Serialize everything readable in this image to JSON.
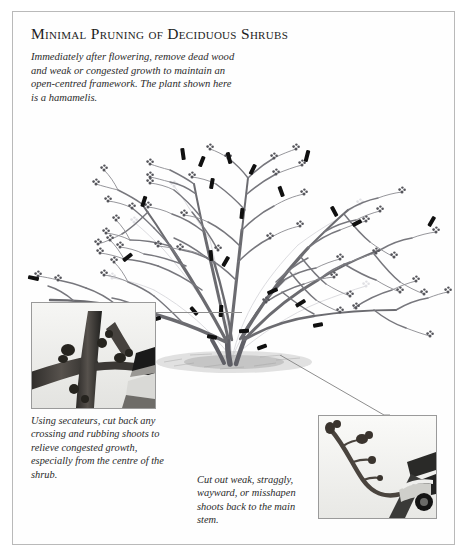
{
  "page": {
    "title": "Minimal Pruning of Deciduous Shrubs",
    "intro": "Immediately after flowering, remove dead wood and weak or congested growth to maintain an open-centred framework. The plant shown here is a hamamelis.",
    "border_color": "#b9b9b9",
    "background_color": "#ffffff"
  },
  "illustration": {
    "name": "deciduous-shrub-line-drawing",
    "subject": "hamamelis",
    "description": "Line drawing of a bare multi-stemmed deciduous shrub with open-centred framework, flower buds on twigs, and black bars marking pruning cuts",
    "stem_color": "#6b6b70",
    "ghost_color": "#d8d8dc",
    "cut_mark_color": "#101010",
    "ground_color": "#bdbdbd",
    "cut_mark_count": 22
  },
  "insets": [
    {
      "name": "inset-secateurs-crossing-shoots",
      "alt": "Close-up photograph of secateurs cutting back crossing and rubbing shoots on thick branches",
      "caption": "Using secateurs, cut back any crossing and rubbing shoots to relieve congested growth, especially from the centre of the shrub.",
      "border_color": "#9a9a9a"
    },
    {
      "name": "inset-secateurs-straggly-shoot",
      "alt": "Close-up photograph of secateurs cutting a weak straggly flowering shoot back to the main stem",
      "caption": "Cut out weak, straggly, wayward, or misshapen shoots back to the main stem.",
      "border_color": "#9a9a9a"
    }
  ],
  "leader_lines": {
    "left": "horizontal line from left inset to shrub base",
    "right": "diagonal line from shrub base down to right inset",
    "color": "#8d8d8d"
  }
}
